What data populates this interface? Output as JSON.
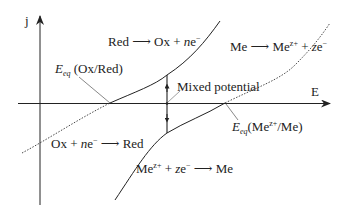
{
  "axes": {
    "y_label": "j",
    "x_label": "E"
  },
  "reactions": {
    "red_ox": {
      "lhs": "Red",
      "arrow": "⟶",
      "rhs_a": "Ox + ",
      "rhs_n": "n",
      "rhs_e": "e",
      "rhs_sup": "−"
    },
    "me_oxidation": {
      "lhs": "Me",
      "arrow": "⟶",
      "rhs_me": "Me",
      "rhs_sup": "z+",
      "rhs_plus": " + ",
      "rhs_z": "z",
      "rhs_e": "e",
      "rhs_e_sup": "−"
    },
    "ox_red": {
      "lhs_a": "Ox + ",
      "lhs_n": "n",
      "lhs_e": "e",
      "lhs_sup": "−",
      "arrow": "⟶",
      "rhs": "Red"
    },
    "me_reduction": {
      "lhs_me": "Me",
      "lhs_sup": "z+",
      "lhs_plus": " + ",
      "lhs_z": "z",
      "lhs_e": "e",
      "lhs_e_sup": "−",
      "arrow": "⟶",
      "rhs": "Me"
    }
  },
  "annotations": {
    "eeq_ox_red": {
      "E": "E",
      "sub": "eq",
      "text": " (Ox/Red)"
    },
    "eeq_me": {
      "E": "E",
      "sub": "eq",
      "text_a": "(Me",
      "sup": "z+",
      "text_b": "/Me)"
    },
    "mixed_potential": "Mixed potential"
  },
  "colors": {
    "line": "#222222",
    "leader": "#555555"
  }
}
